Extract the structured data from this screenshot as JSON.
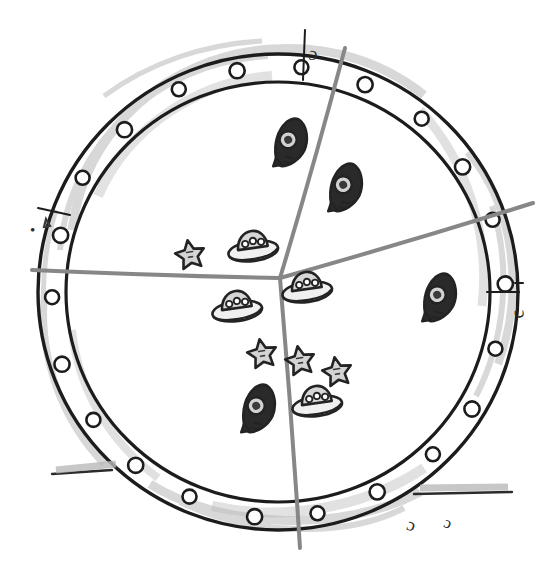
{
  "figure": {
    "style": "pencil-sketch",
    "background_color": "#ffffff",
    "ink_color": "#1c1c1c",
    "divider_color": "#878787",
    "shade_color": "#b9b9b9"
  },
  "frame": {
    "name": "porthole-ring",
    "center_x": 278,
    "center_y": 292,
    "outer_radius": 240,
    "inner_radius": 212,
    "rivet_count": 22,
    "rivet_radius": 7
  },
  "labels": {
    "top": "c",
    "right": "c",
    "left": "•",
    "bottom_right_1": "c",
    "bottom_right_2": "c"
  },
  "chart_data": {
    "type": "pie",
    "xlabel": "",
    "ylabel": "",
    "center": [
      278,
      280
    ],
    "radius": 212,
    "grid": false,
    "legend": "none",
    "categories": [
      "rocket",
      "ufo",
      "star"
    ],
    "values": [
      33,
      42,
      25
    ],
    "slices": [
      {
        "name": "top-right-slice",
        "label": "c",
        "start_angle_deg": -76,
        "end_angle_deg": 16,
        "value": 33,
        "icon": "rocket",
        "icon_count": 3
      },
      {
        "name": "bottom-slice",
        "label": "c",
        "start_angle_deg": 16,
        "end_angle_deg": 93,
        "value": 25,
        "icon": "ufo",
        "icon_count": 3
      },
      {
        "name": "left-slice",
        "label": "•",
        "start_angle_deg": 93,
        "end_angle_deg": 284,
        "value": 42,
        "icon": "star",
        "icon_count": 4
      }
    ],
    "markers": [
      {
        "icon": "rocket",
        "x": 288,
        "y": 142,
        "rotation": -22,
        "scale": 1.0
      },
      {
        "icon": "rocket",
        "x": 343,
        "y": 187,
        "rotation": -22,
        "scale": 1.0
      },
      {
        "icon": "rocket",
        "x": 437,
        "y": 297,
        "rotation": -22,
        "scale": 1.0
      },
      {
        "icon": "rocket",
        "x": 256,
        "y": 408,
        "rotation": -22,
        "scale": 1.0
      },
      {
        "icon": "ufo",
        "x": 253,
        "y": 249,
        "rotation": -8,
        "scale": 1.0
      },
      {
        "icon": "ufo",
        "x": 237,
        "y": 309,
        "rotation": -8,
        "scale": 1.0
      },
      {
        "icon": "ufo",
        "x": 307,
        "y": 290,
        "rotation": -8,
        "scale": 1.0
      },
      {
        "icon": "ufo",
        "x": 317,
        "y": 404,
        "rotation": -8,
        "scale": 1.0
      },
      {
        "icon": "star",
        "x": 190,
        "y": 254,
        "rotation": -10,
        "scale": 1.0
      },
      {
        "icon": "star",
        "x": 262,
        "y": 353,
        "rotation": -10,
        "scale": 1.0
      },
      {
        "icon": "star",
        "x": 300,
        "y": 360,
        "rotation": -10,
        "scale": 1.0
      },
      {
        "icon": "star",
        "x": 337,
        "y": 371,
        "rotation": -10,
        "scale": 1.0
      }
    ],
    "dividers": [
      {
        "name": "divider-up",
        "x1": 280,
        "y1": 278,
        "x2": 345,
        "y2": 48
      },
      {
        "name": "divider-right",
        "x1": 280,
        "y1": 278,
        "x2": 533,
        "y2": 203
      },
      {
        "name": "divider-down",
        "x1": 280,
        "y1": 278,
        "x2": 300,
        "y2": 548
      },
      {
        "name": "divider-left",
        "x1": 280,
        "y1": 278,
        "x2": 32,
        "y2": 270
      }
    ]
  }
}
